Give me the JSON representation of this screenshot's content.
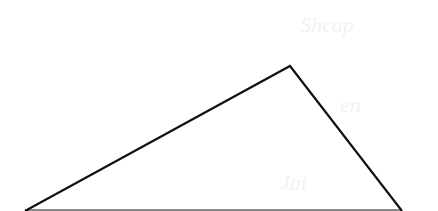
{
  "diagram": {
    "type": "triangle",
    "stroke_color": "#111111",
    "base_color": "#8a8a8a",
    "background": "#ffffff",
    "vertices": {
      "apex": [
        290,
        66
      ],
      "bottom_left": [
        25,
        211
      ],
      "bottom_right": [
        402,
        211
      ]
    },
    "ghost_text": [
      {
        "text": "Shcap",
        "x": 300,
        "y": 30
      },
      {
        "text": "en",
        "x": 340,
        "y": 112
      },
      {
        "text": "Jai",
        "x": 280,
        "y": 188
      }
    ]
  }
}
